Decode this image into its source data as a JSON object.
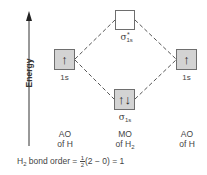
{
  "diagram": {
    "axis": {
      "label": "Energy",
      "direction": "up"
    },
    "orbitals": [
      {
        "id": "ao-left-1s",
        "label": "1s",
        "electrons": "↑",
        "filled": true
      },
      {
        "id": "mo-sigma-star-1s",
        "label_symbol": "σ",
        "label_sub": "1s",
        "label_sup": "*",
        "electrons": "",
        "filled": false
      },
      {
        "id": "mo-sigma-1s",
        "label_symbol": "σ",
        "label_sub": "1s",
        "label_sup": "",
        "electrons": "↑↓",
        "filled": true
      },
      {
        "id": "ao-right-1s",
        "label": "1s",
        "electrons": "↑",
        "filled": true
      }
    ],
    "columns": [
      {
        "line1": "AO",
        "line2": "of H"
      },
      {
        "line1": "MO",
        "line2_prefix": "of H",
        "line2_sub": "2"
      },
      {
        "line1": "AO",
        "line2": "of H"
      }
    ],
    "bond_order": {
      "prefix": "H",
      "prefix_sub": "2",
      "text": " bond order = ",
      "frac_num": "1",
      "frac_den": "2",
      "expression": "(2 − 0) = 1"
    },
    "colors": {
      "box_fill": "#d3d3d3",
      "box_border": "#6e6e6e",
      "dash": "#444444"
    }
  }
}
